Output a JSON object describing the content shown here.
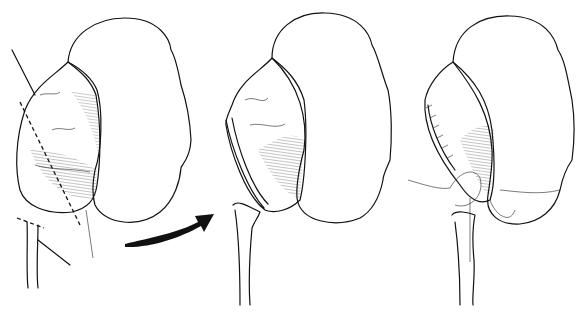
{
  "figure": {
    "panels": [
      {
        "id": "A",
        "label": "A",
        "description": "kidney with dilated renal pelvis, dashed excision lines marked"
      },
      {
        "id": "middle",
        "label": "",
        "description": "pelvis excised, ureter spatulated"
      },
      {
        "id": "B",
        "label": "B",
        "description": "ureter anastomosed to pelvis with sutures"
      }
    ],
    "colors": {
      "ink": "#111111",
      "background": "#ffffff"
    }
  }
}
